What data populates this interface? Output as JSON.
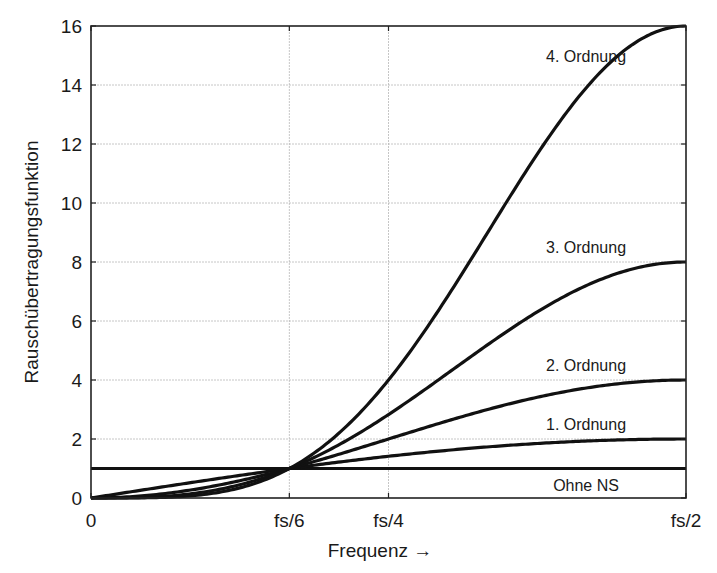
{
  "chart_data": {
    "type": "line",
    "title": "",
    "xlabel": "Frequenz →",
    "ylabel": "Rauschübertragungsfunktion",
    "xlim": [
      0,
      0.5
    ],
    "ylim": [
      0,
      16
    ],
    "grid": true,
    "legend": "inline labels",
    "x_ticks": [
      {
        "value": 0,
        "label": "0"
      },
      {
        "value": 0.16667,
        "label": "fs/6"
      },
      {
        "value": 0.25,
        "label": "fs/4"
      },
      {
        "value": 0.5,
        "label": "fs/2"
      }
    ],
    "y_ticks": [
      0,
      2,
      4,
      6,
      8,
      10,
      12,
      14,
      16
    ],
    "x": [
      0,
      0.0625,
      0.125,
      0.16667,
      0.1875,
      0.25,
      0.3125,
      0.375,
      0.4375,
      0.5
    ],
    "series": [
      {
        "name": "Ohne NS",
        "order": 0,
        "values": [
          1,
          1,
          1,
          1,
          1,
          1,
          1,
          1,
          1,
          1
        ]
      },
      {
        "name": "1. Ordnung",
        "order": 1,
        "values": [
          0,
          0.39,
          0.77,
          1.0,
          1.11,
          1.41,
          1.66,
          1.85,
          1.96,
          2.0
        ]
      },
      {
        "name": "2. Ordnung",
        "order": 2,
        "values": [
          0,
          0.15,
          0.59,
          1.0,
          1.23,
          2.0,
          2.76,
          3.41,
          3.85,
          4.0
        ]
      },
      {
        "name": "3. Ordnung",
        "order": 3,
        "values": [
          0,
          0.06,
          0.45,
          1.0,
          1.37,
          2.83,
          4.59,
          6.31,
          7.54,
          8.0
        ]
      },
      {
        "name": "4. Ordnung",
        "order": 4,
        "values": [
          0,
          0.02,
          0.34,
          1.0,
          1.52,
          4.0,
          7.62,
          11.66,
          14.8,
          16.0
        ]
      }
    ],
    "formula": "(2*sin(pi*f/fs))^n",
    "annotations": [
      {
        "text": "4. Ordnung",
        "x": 0.416,
        "y": 15.0
      },
      {
        "text": "3. Ordnung",
        "x": 0.416,
        "y": 8.5
      },
      {
        "text": "2. Ordnung",
        "x": 0.416,
        "y": 4.5
      },
      {
        "text": "1. Ordnung",
        "x": 0.416,
        "y": 2.5
      },
      {
        "text": "Ohne NS",
        "x": 0.416,
        "y": 0.45
      }
    ]
  },
  "colors": {
    "line": "#111111",
    "grid": "#b8b8b8",
    "axis": "#222222",
    "background": "#ffffff"
  }
}
